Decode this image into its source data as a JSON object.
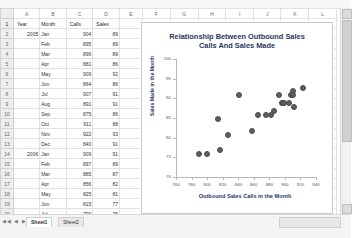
{
  "spreadsheet": {
    "column_letters": [
      "A",
      "B",
      "C",
      "D",
      "E",
      "F",
      "G",
      "H",
      "I",
      "J",
      "K",
      "L"
    ],
    "headers": [
      "Year",
      "Month",
      "Calls",
      "Sales"
    ],
    "rows": [
      {
        "n": "2",
        "year": "2005",
        "month": "Jan",
        "calls": "904",
        "sales": "89"
      },
      {
        "n": "3",
        "year": "",
        "month": "Feb",
        "calls": "895",
        "sales": "89"
      },
      {
        "n": "4",
        "year": "",
        "month": "Mar",
        "calls": "896",
        "sales": "89"
      },
      {
        "n": "5",
        "year": "",
        "month": "Apr",
        "calls": "881",
        "sales": "86"
      },
      {
        "n": "6",
        "year": "",
        "month": "May",
        "calls": "909",
        "sales": "92"
      },
      {
        "n": "7",
        "year": "",
        "month": "Jun",
        "calls": "864",
        "sales": "86"
      },
      {
        "n": "8",
        "year": "",
        "month": "Jul",
        "calls": "907",
        "sales": "91"
      },
      {
        "n": "9",
        "year": "",
        "month": "Aug",
        "calls": "891",
        "sales": "91"
      },
      {
        "n": "10",
        "year": "",
        "month": "Sep",
        "calls": "875",
        "sales": "86"
      },
      {
        "n": "11",
        "year": "",
        "month": "Oct",
        "calls": "911",
        "sales": "88"
      },
      {
        "n": "12",
        "year": "",
        "month": "Nov",
        "calls": "922",
        "sales": "93"
      },
      {
        "n": "13",
        "year": "",
        "month": "Dec",
        "calls": "840",
        "sales": "91"
      },
      {
        "n": "14",
        "year": "2006",
        "month": "Jan",
        "calls": "909",
        "sales": "91"
      },
      {
        "n": "15",
        "year": "",
        "month": "Feb",
        "calls": "897",
        "sales": "89"
      },
      {
        "n": "16",
        "year": "",
        "month": "Mar",
        "calls": "885",
        "sales": "87"
      },
      {
        "n": "17",
        "year": "",
        "month": "Apr",
        "calls": "856",
        "sales": "82"
      },
      {
        "n": "18",
        "year": "",
        "month": "May",
        "calls": "825",
        "sales": "81"
      },
      {
        "n": "19",
        "year": "",
        "month": "Jun",
        "calls": "815",
        "sales": "77"
      },
      {
        "n": "20",
        "year": "",
        "month": "Jul",
        "calls": "799",
        "sales": "76"
      },
      {
        "n": "21",
        "year": "",
        "month": "Aug",
        "calls": "813",
        "sales": "85"
      },
      {
        "n": "22",
        "year": "",
        "month": "Sep",
        "calls": "788",
        "sales": "76"
      }
    ],
    "header_row_number": "1",
    "sheet_tabs": [
      {
        "label": "Sheet1",
        "active": true
      },
      {
        "label": "Sheet2",
        "active": false
      }
    ],
    "nav_buttons": "◀◀ ◀ ▶ ▶▶"
  },
  "chart_data": {
    "type": "scatter",
    "title": "Relationship Between Outbound Sales Calls And Sales Made",
    "title_line1": "Relationship Between Outbound Sales",
    "title_line2": "Calls And Sales Made",
    "xlabel": "Outbound Sales Calls in the Month",
    "ylabel": "Sales Made in the Month",
    "xlim": [
      760,
      940
    ],
    "ylim": [
      70,
      100
    ],
    "xticks": [
      760,
      780,
      800,
      820,
      840,
      860,
      880,
      900,
      920,
      940
    ],
    "yticks": [
      70,
      75,
      80,
      85,
      90,
      95,
      100
    ],
    "grid": false,
    "legend": "none",
    "marker_color": "#5f5f5f",
    "x": [
      904,
      895,
      896,
      881,
      909,
      864,
      907,
      891,
      875,
      911,
      922,
      840,
      909,
      897,
      885,
      856,
      825,
      815,
      799,
      813,
      788
    ],
    "y": [
      89,
      89,
      89,
      86,
      92,
      86,
      91,
      91,
      86,
      88,
      93,
      91,
      91,
      89,
      87,
      82,
      81,
      77,
      76,
      85,
      76
    ]
  }
}
